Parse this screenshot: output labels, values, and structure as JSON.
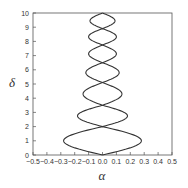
{
  "chart_data": {
    "type": "line",
    "title": "",
    "xlabel": "α",
    "ylabel": "δ",
    "xlim": [
      -0.5,
      0.5
    ],
    "ylim": [
      0,
      10
    ],
    "grid": false,
    "legend": null,
    "xticks": [
      "-0.5",
      "-0.4",
      "-0.3",
      "-0.2",
      "-0.1",
      "0.0",
      "0.1",
      "0.2",
      "0.3",
      "0.4",
      "0.5"
    ],
    "yticks": [
      "0",
      "1",
      "2",
      "3",
      "4",
      "5",
      "6",
      "7",
      "8",
      "9",
      "10"
    ],
    "line_color": "#333333",
    "crossings_delta": [
      0,
      2.0,
      3.5,
      5.1,
      6.5,
      7.75,
      8.9,
      10
    ],
    "lobe_max_alpha": [
      0.28,
      0.18,
      0.14,
      0.12,
      0.1,
      0.1,
      0.09
    ],
    "series": [
      {
        "name": "upper-branch",
        "points": [
          [
            0,
            0
          ],
          [
            0.28,
            1.0
          ],
          [
            0,
            2.0
          ],
          [
            -0.18,
            2.75
          ],
          [
            0,
            3.5
          ],
          [
            0.14,
            4.3
          ],
          [
            0,
            5.1
          ],
          [
            -0.12,
            5.8
          ],
          [
            0,
            6.5
          ],
          [
            0.1,
            7.1
          ],
          [
            0,
            7.75
          ],
          [
            -0.1,
            8.3
          ],
          [
            0,
            8.9
          ],
          [
            0.09,
            9.45
          ],
          [
            0,
            10
          ]
        ]
      },
      {
        "name": "lower-branch",
        "points": [
          [
            0,
            0
          ],
          [
            -0.28,
            1.0
          ],
          [
            0,
            2.0
          ],
          [
            0.18,
            2.75
          ],
          [
            0,
            3.5
          ],
          [
            -0.14,
            4.3
          ],
          [
            0,
            5.1
          ],
          [
            0.12,
            5.8
          ],
          [
            0,
            6.5
          ],
          [
            -0.1,
            7.1
          ],
          [
            0,
            7.75
          ],
          [
            0.1,
            8.3
          ],
          [
            0,
            8.9
          ],
          [
            -0.09,
            9.45
          ],
          [
            0,
            10
          ]
        ]
      }
    ]
  }
}
